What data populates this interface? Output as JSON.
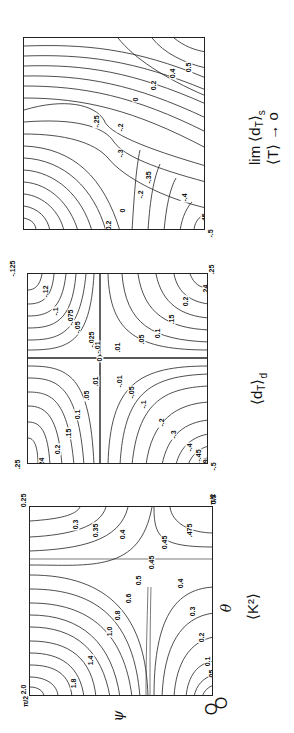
{
  "chart_data": [
    {
      "type": "heatmap",
      "subtype": "contour",
      "title": "lim <d_T>_s  (<T> → 0)",
      "caption_line1": "lim ⟨d",
      "caption_sub": "T",
      "caption_sup": "s",
      "caption_line2": "⟨T⟩ → o",
      "orientation": "rotated 90° counter-clockwise",
      "corner_labels": {
        "bottom_right": "-.5"
      },
      "contour_levels": [
        "0.6",
        "0.5",
        "0.4",
        "0.2",
        "0",
        "-.2",
        "-.25",
        "-.3",
        "-.35",
        "-.4",
        "-.45",
        "-.49"
      ],
      "xlabel": "θ",
      "ylabel": "ψ",
      "x_range": [
        0,
        "π/2"
      ],
      "y_range": [
        0,
        "π/2"
      ]
    },
    {
      "type": "heatmap",
      "subtype": "contour",
      "title": "<d_T>_d",
      "caption": "⟨d",
      "caption_sub": "T",
      "caption_sup": "d",
      "orientation": "rotated 90° counter-clockwise",
      "corner_labels": {
        "top_left": "-.125",
        "top_right": ".25",
        "bottom_left": ".25",
        "bottom_right": "-.5"
      },
      "contour_levels_upper_left": [
        "-.12",
        "-.1",
        "-.075",
        "-.05",
        "-.025",
        "-.01"
      ],
      "contour_levels_upper_right": [
        ".01",
        ".05",
        "0.1",
        ".15",
        "0.2",
        ".24"
      ],
      "contour_levels_lower_left": [
        ".01",
        ".05",
        "0.1",
        ".15",
        "0.2",
        ".24"
      ],
      "contour_levels_lower_right": [
        "-.01",
        "-.05",
        "-.1",
        "-.2",
        "-.3",
        "-.4",
        "-.45",
        "-.49"
      ],
      "zero_label": "0",
      "xlabel": "θ",
      "ylabel": "ψ"
    },
    {
      "type": "heatmap",
      "subtype": "contour",
      "title": "<K^2>",
      "caption": "⟨K",
      "caption_sup": "2",
      "orientation": "rotated 90° counter-clockwise",
      "corner_labels": {
        "top_left": "0.25",
        "top_right": "0.5",
        "bottom_left": "2.0"
      },
      "contour_levels": [
        "1.8",
        "1.4",
        "1.0",
        "0.8",
        "0.6",
        "0.5",
        "0.45",
        "0.4",
        "0.35",
        "0.3",
        "0.2",
        "0.1",
        ".05",
        ".02",
        ".475"
      ],
      "xlabel": "θ",
      "ylabel": "ψ",
      "x_ticks": [
        "0",
        "π/2"
      ],
      "y_ticks": [
        "0",
        "π/2"
      ],
      "x_range": [
        0,
        "π/2"
      ],
      "y_range": [
        0,
        "π/2"
      ]
    }
  ],
  "panels": {
    "top": {
      "labels": [
        {
          "t": "0.6",
          "x": 179,
          "y": 22
        },
        {
          "t": "0.5",
          "x": 159,
          "y": 26
        },
        {
          "t": "0.4",
          "x": 143,
          "y": 32
        },
        {
          "t": "0.2",
          "x": 124,
          "y": 44
        },
        {
          "t": "0",
          "x": 109,
          "y": 58
        },
        {
          "t": "-.25",
          "x": 65,
          "y": 80
        },
        {
          "t": "-.2",
          "x": 91,
          "y": 86
        },
        {
          "t": "-.3",
          "x": 91,
          "y": 112
        },
        {
          "t": "-.35",
          "x": 117,
          "y": 136
        },
        {
          "t": "-.2",
          "x": 111,
          "y": 153
        },
        {
          "t": "0",
          "x": 96,
          "y": 169
        },
        {
          "t": "0.2",
          "x": 79,
          "y": 184
        },
        {
          "t": "0.4",
          "x": 63,
          "y": 196
        },
        {
          "t": "0.5",
          "x": 50,
          "y": 203
        },
        {
          "t": "0.6",
          "x": 32,
          "y": 221
        },
        {
          "t": "-.4",
          "x": 155,
          "y": 156
        },
        {
          "t": "-.45",
          "x": 173,
          "y": 178
        },
        {
          "t": "-.49",
          "x": 195,
          "y": 201
        }
      ],
      "corner": {
        "t": "-.5",
        "x": 206,
        "y": 230
      }
    },
    "middle": {
      "labels": [
        {
          "t": "-.12",
          "x": 10,
          "y": 14
        },
        {
          "t": "-.1",
          "x": 22,
          "y": 34
        },
        {
          "t": "-.075",
          "x": 34,
          "y": 40
        },
        {
          "t": "-.05",
          "x": 42,
          "y": 50
        },
        {
          "t": "-.025",
          "x": 55,
          "y": 62
        },
        {
          "t": "-.01",
          "x": 62,
          "y": 70
        },
        {
          "t": ".01",
          "x": 84,
          "y": 70
        },
        {
          "t": ".05",
          "x": 108,
          "y": 62
        },
        {
          "t": "0.1",
          "x": 124,
          "y": 56
        },
        {
          "t": ".15",
          "x": 138,
          "y": 42
        },
        {
          "t": "0.2",
          "x": 152,
          "y": 24
        },
        {
          "t": ".24",
          "x": 172,
          "y": 12
        },
        {
          "t": "0",
          "x": 69,
          "y": 82
        },
        {
          "t": ".01",
          "x": 62,
          "y": 104
        },
        {
          "t": ".05",
          "x": 53,
          "y": 118
        },
        {
          "t": "0.1",
          "x": 44,
          "y": 137
        },
        {
          "t": ".15",
          "x": 35,
          "y": 156
        },
        {
          "t": "0.2",
          "x": 24,
          "y": 172
        },
        {
          "t": ".24",
          "x": 8,
          "y": 185
        },
        {
          "t": "-.01",
          "x": 84,
          "y": 104
        },
        {
          "t": "-.05",
          "x": 96,
          "y": 115
        },
        {
          "t": "-.1",
          "x": 110,
          "y": 127
        },
        {
          "t": "-.2",
          "x": 128,
          "y": 145
        },
        {
          "t": "-.3",
          "x": 140,
          "y": 157
        },
        {
          "t": "-.4",
          "x": 156,
          "y": 170
        },
        {
          "t": "-.45",
          "x": 163,
          "y": 178
        },
        {
          "t": "-.49",
          "x": 170,
          "y": 188
        }
      ],
      "corners": [
        {
          "t": "-.125",
          "x": -22,
          "y": -8
        },
        {
          "t": ".25",
          "x": 180,
          "y": -7
        },
        {
          "t": ".25",
          "x": -14,
          "y": 188
        },
        {
          "t": "-.5",
          "x": 182,
          "y": 190
        }
      ]
    },
    "bottom": {
      "labels": [
        {
          "t": "0.3",
          "x": 40,
          "y": 14
        },
        {
          "t": "0.35",
          "x": 58,
          "y": 20
        },
        {
          "t": "0.4",
          "x": 87,
          "y": 24
        },
        {
          "t": "0.45",
          "x": 127,
          "y": 32
        },
        {
          "t": ".475",
          "x": 152,
          "y": 20
        },
        {
          "t": "0.45",
          "x": 114,
          "y": 52
        },
        {
          "t": "0.5",
          "x": 103,
          "y": 70
        },
        {
          "t": "0.6",
          "x": 93,
          "y": 88
        },
        {
          "t": "0.8",
          "x": 82,
          "y": 105
        },
        {
          "t": "1.0",
          "x": 74,
          "y": 121
        },
        {
          "t": "1.4",
          "x": 55,
          "y": 150
        },
        {
          "t": "1.8",
          "x": 38,
          "y": 173
        },
        {
          "t": "0.4",
          "x": 145,
          "y": 73
        },
        {
          "t": "0.3",
          "x": 157,
          "y": 101
        },
        {
          "t": "0.2",
          "x": 166,
          "y": 127
        },
        {
          "t": "0.1",
          "x": 172,
          "y": 151
        },
        {
          "t": ".05",
          "x": 176,
          "y": 164
        },
        {
          "t": ".02",
          "x": 180,
          "y": 175
        }
      ],
      "corners": [
        {
          "t": "0.25",
          "x": -12,
          "y": -9
        },
        {
          "t": "0.5",
          "x": 180,
          "y": -10
        },
        {
          "t": "2.0",
          "x": -10,
          "y": 180
        }
      ],
      "tick_pi_over_2_left": "π/2",
      "tick_pi_over_2_right": "π/2",
      "axis_theta": "θ",
      "axis_psi": "ψ",
      "origin": "O",
      "origin2": "O",
      "caption": "⟨K²⟩"
    }
  }
}
